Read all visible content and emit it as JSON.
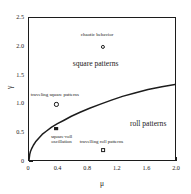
{
  "chart_data": {
    "type": "line",
    "title": "",
    "xlabel": "μ",
    "ylabel": "γ",
    "xlim": [
      0,
      2.0
    ],
    "ylim": [
      0,
      2.5
    ],
    "grid": false,
    "legend": "none",
    "xticks": [
      {
        "value": 0,
        "label": "0"
      },
      {
        "value": 0.4,
        "label": "0.4"
      },
      {
        "value": 0.8,
        "label": "0.8"
      },
      {
        "value": 1.2,
        "label": "1.2"
      },
      {
        "value": 1.6,
        "label": "1.6"
      },
      {
        "value": 2.0,
        "label": "2.0"
      }
    ],
    "xminor": [
      0.2,
      0.6,
      1.0,
      1.4,
      1.8
    ],
    "yticks": [
      {
        "value": 0,
        "label": "0"
      },
      {
        "value": 0.5,
        "label": "0.5"
      },
      {
        "value": 1.0,
        "label": "1.0"
      },
      {
        "value": 1.5,
        "label": "1.5"
      },
      {
        "value": 2.0,
        "label": "2.0"
      },
      {
        "value": 2.5,
        "label": "2.5"
      }
    ],
    "yminor": [
      0.25,
      0.75,
      1.25,
      1.75,
      2.25
    ],
    "series": [
      {
        "name": "square-roll transition boundary",
        "style": "solid-black-curve",
        "x": [
          0.0,
          0.01,
          0.02,
          0.04,
          0.06,
          0.09,
          0.13,
          0.18,
          0.24,
          0.31,
          0.39,
          0.48,
          0.58,
          0.7,
          0.83,
          0.97,
          1.12,
          1.28,
          1.45,
          1.63,
          1.82,
          2.0
        ],
        "y": [
          0.0,
          0.1,
          0.15,
          0.21,
          0.26,
          0.32,
          0.38,
          0.45,
          0.51,
          0.58,
          0.64,
          0.7,
          0.77,
          0.84,
          0.91,
          0.98,
          1.05,
          1.12,
          1.18,
          1.24,
          1.29,
          1.33
        ]
      }
    ],
    "region_labels": [
      {
        "text": "square patterns",
        "x": 0.9,
        "y": 1.72
      },
      {
        "text": "roll patterns",
        "x": 1.61,
        "y": 0.67
      }
    ],
    "annotations": [
      {
        "text": "chaotic behavior",
        "marker": "circle-open",
        "x": 1.0,
        "y": 2.0,
        "label_x": 0.92,
        "label_y": 2.2
      },
      {
        "text": "traveling square patterns",
        "marker": "circle-open",
        "x": 0.37,
        "y": 1.0,
        "label_x": 0.35,
        "label_y": 1.17
      },
      {
        "text": "square-roll oscillation",
        "marker": "square-filled",
        "x": 0.37,
        "y": 0.58,
        "label_x": 0.44,
        "label_y": 0.4
      },
      {
        "text": "travelling  roll patterns",
        "marker": "square-open",
        "x": 1.0,
        "y": 0.2,
        "label_x": 0.98,
        "label_y": 0.35
      }
    ],
    "colors": {
      "curve": "#1c1c1c",
      "axis": "#1c1c1c",
      "text": "#1a1a1a",
      "background": "#ffffff"
    }
  }
}
